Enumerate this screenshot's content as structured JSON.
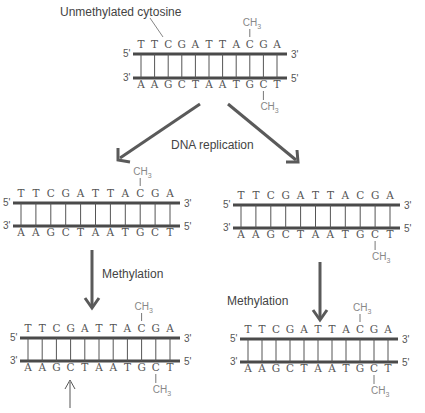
{
  "title_label": "Unmethylated cytosine",
  "process_labels": {
    "replication": "DNA replication",
    "methylation_left": "Methylation",
    "methylation_right": "Methylation"
  },
  "colors": {
    "strand": "#4a4a4a",
    "rung": "#555555",
    "arrow": "#5a5a5a",
    "text": "#444444",
    "methyl": "#888888"
  },
  "sequence": {
    "top_strand": [
      "T",
      "T",
      "C",
      "G",
      "A",
      "T",
      "T",
      "A",
      "C",
      "G",
      "A"
    ],
    "bottom_strand": [
      "A",
      "A",
      "G",
      "C",
      "T",
      "A",
      "A",
      "T",
      "G",
      "C",
      "T"
    ],
    "top_5": "5'",
    "top_3": "3'",
    "bottom_3": "3'",
    "bottom_5": "5'"
  },
  "methyl_group": "CH3",
  "duplexes": [
    {
      "id": "parent",
      "position": "top-center",
      "methyl_top_index": 8,
      "methyl_bottom_index": 9,
      "annotation": "unmethylated cytosine at top strand index 2"
    },
    {
      "id": "daughter-left",
      "position": "middle-left",
      "methyl_top_index": 8,
      "methyl_bottom_index": null
    },
    {
      "id": "daughter-right",
      "position": "middle-right",
      "methyl_top_index": null,
      "methyl_bottom_index": 9
    },
    {
      "id": "methylated-left",
      "position": "bottom-left",
      "methyl_top_index": 8,
      "methyl_bottom_index": 9,
      "arrow_marker_bottom_index": 3
    },
    {
      "id": "methylated-right",
      "position": "bottom-right",
      "methyl_top_index": 8,
      "methyl_bottom_index": 9
    }
  ]
}
